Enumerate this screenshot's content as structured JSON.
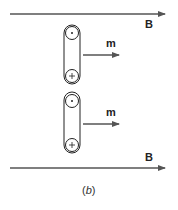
{
  "figure": {
    "caption_open": "(",
    "caption_letter": "b",
    "caption_close": ")",
    "colors": {
      "arrow": "#555555",
      "stroke": "#222222",
      "background": "#ffffff"
    }
  },
  "field_top": {
    "label": "B",
    "description": "uniform magnetic field arrow (top)"
  },
  "field_bottom": {
    "label": "B",
    "description": "uniform magnetic field arrow (bottom)"
  },
  "loops": [
    {
      "moment_label": "m",
      "top_symbol": "dot",
      "bottom_symbol": "cross"
    },
    {
      "moment_label": "m",
      "top_symbol": "dot",
      "bottom_symbol": "cross"
    }
  ]
}
